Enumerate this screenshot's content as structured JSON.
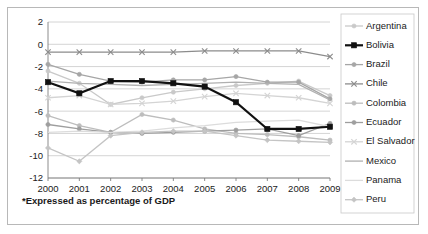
{
  "figure": {
    "footnote": "*Expressed as percentage of GDP",
    "background": "#ffffff",
    "border_color": "#b8b8b8"
  },
  "chart_data": {
    "type": "line",
    "title": "",
    "subtitle": "",
    "xlabel": "",
    "ylabel": "",
    "footnote": "*Expressed as percentage of GDP",
    "grid": true,
    "legend_position": "right",
    "x": [
      "2000",
      "2001",
      "2002",
      "2003",
      "2004",
      "2005",
      "2006",
      "2007",
      "2008",
      "2009"
    ],
    "categories": [
      "2000",
      "2001",
      "2002",
      "2003",
      "2004",
      "2005",
      "2006",
      "2007",
      "2008",
      "2009"
    ],
    "xlim": [
      2000,
      2009
    ],
    "ylim": [
      -12,
      2
    ],
    "yticks": [
      2,
      0,
      -2,
      -4,
      -6,
      -8,
      -10,
      -12
    ],
    "ytick_labels": [
      "2",
      "0",
      "-2",
      "-4",
      "-6",
      "-8",
      "-10",
      "-12"
    ],
    "xtick_labels": [
      "2000",
      "2001",
      "2002",
      "2003",
      "2004",
      "2005",
      "2006",
      "2007",
      "2008",
      "2009"
    ],
    "series": [
      {
        "name": "Argentina",
        "color": "#c9c9c9",
        "marker": "circle",
        "width": "thin",
        "values": [
          -2.4,
          -3.5,
          -5.4,
          -4.8,
          -4.3,
          -4.0,
          -3.7,
          -3.5,
          -3.3,
          -4.6
        ]
      },
      {
        "name": "Bolivia",
        "color": "#111111",
        "marker": "square",
        "width": "bold",
        "values": [
          -3.4,
          -4.4,
          -3.3,
          -3.3,
          -3.5,
          -3.8,
          -5.2,
          -7.6,
          -7.6,
          -7.4
        ]
      },
      {
        "name": "Brazil",
        "color": "#a6a6a6",
        "marker": "circle",
        "width": "thin",
        "values": [
          -1.8,
          -2.7,
          -3.3,
          -3.4,
          -3.2,
          -3.2,
          -2.9,
          -3.4,
          -3.4,
          -4.9
        ]
      },
      {
        "name": "Chile",
        "color": "#8c8c8c",
        "marker": "cross",
        "width": "thin",
        "values": [
          -0.7,
          -0.7,
          -0.7,
          -0.7,
          -0.7,
          -0.6,
          -0.6,
          -0.6,
          -0.6,
          -1.1
        ]
      },
      {
        "name": "Colombia",
        "color": "#bdbdbd",
        "marker": "circle",
        "width": "thin",
        "values": [
          -6.4,
          -7.3,
          -7.9,
          -6.3,
          -6.8,
          -7.6,
          -8.0,
          -8.1,
          -8.3,
          -8.6
        ]
      },
      {
        "name": "Ecuador",
        "color": "#9e9e9e",
        "marker": "circle",
        "width": "thin",
        "values": [
          -7.2,
          -7.6,
          -7.9,
          -8.0,
          -7.9,
          -7.8,
          -7.7,
          -7.6,
          -8.2,
          -7.1
        ]
      },
      {
        "name": "El Salvador",
        "color": "#d4d4d4",
        "marker": "cross",
        "width": "thin",
        "values": [
          -4.8,
          -4.6,
          -5.4,
          -5.3,
          -5.1,
          -4.7,
          -4.4,
          -4.6,
          -4.8,
          -5.3
        ]
      },
      {
        "name": "Mexico",
        "color": "#b0b0b0",
        "marker": "none",
        "width": "thin",
        "values": [
          -3.3,
          -3.5,
          -3.6,
          -3.7,
          -3.6,
          -3.5,
          -3.4,
          -3.5,
          -3.6,
          -5.0
        ]
      },
      {
        "name": "Panama",
        "color": "#dcdcdc",
        "marker": "none",
        "width": "thin",
        "values": [
          -7.9,
          -7.8,
          -7.9,
          -7.8,
          -7.5,
          -7.3,
          -7.0,
          -6.9,
          -6.8,
          -7.4
        ]
      },
      {
        "name": "Peru",
        "color": "#c4c4c4",
        "marker": "diamond",
        "width": "thin",
        "values": [
          -9.3,
          -10.5,
          -8.2,
          -7.9,
          -7.8,
          -7.8,
          -8.2,
          -8.6,
          -8.7,
          -8.8
        ]
      }
    ]
  },
  "legend": {
    "items": [
      {
        "label": "Argentina",
        "color": "#c9c9c9",
        "marker": "circle"
      },
      {
        "label": "Bolivia",
        "color": "#111111",
        "marker": "square"
      },
      {
        "label": "Brazil",
        "color": "#a6a6a6",
        "marker": "circle"
      },
      {
        "label": "Chile",
        "color": "#8c8c8c",
        "marker": "cross"
      },
      {
        "label": "Colombia",
        "color": "#bdbdbd",
        "marker": "circle"
      },
      {
        "label": "Ecuador",
        "color": "#9e9e9e",
        "marker": "circle"
      },
      {
        "label": "El Salvador",
        "color": "#d4d4d4",
        "marker": "cross"
      },
      {
        "label": "Mexico",
        "color": "#b0b0b0",
        "marker": "none"
      },
      {
        "label": "Panama",
        "color": "#dcdcdc",
        "marker": "none"
      },
      {
        "label": "Peru",
        "color": "#c4c4c4",
        "marker": "diamond"
      }
    ]
  }
}
